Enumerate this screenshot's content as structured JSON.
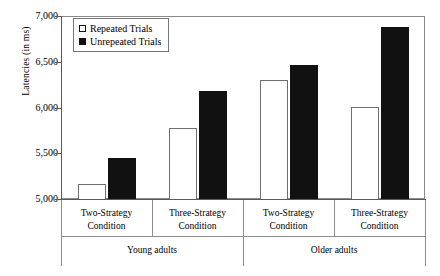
{
  "chart_data": {
    "type": "bar",
    "title": "",
    "xlabel": "",
    "ylabel": "Latencies (in ms)",
    "ylim": [
      5000,
      7000
    ],
    "ytick_labels": [
      "7,000",
      "6,500",
      "6,000",
      "5,500",
      "5,000"
    ],
    "ytick_values": [
      7000,
      6500,
      6000,
      5500,
      5000
    ],
    "grid": false,
    "legend_position": "top-left inside plot",
    "categories": [
      "Two-Strategy Condition",
      "Three-Strategy Condition",
      "Two-Strategy Condition",
      "Three-Strategy Condition"
    ],
    "category_lines": [
      [
        "Two-Strategy",
        "Condition"
      ],
      [
        "Three-Strategy",
        "Condition"
      ],
      [
        "Two-Strategy",
        "Condition"
      ],
      [
        "Three-Strategy",
        "Condition"
      ]
    ],
    "groups": [
      {
        "label": "Young adults",
        "categories": [
          0,
          1
        ]
      },
      {
        "label": "Older adults",
        "categories": [
          2,
          3
        ]
      }
    ],
    "series": [
      {
        "name": "Repeated Trials",
        "style": "open",
        "color": "#ffffff",
        "edge_color": "#6f6f6f",
        "values": [
          5165,
          5780,
          6300,
          6010
        ]
      },
      {
        "name": "Unrepeated Trials",
        "style": "filled",
        "color": "#111111",
        "edge_color": "#111111",
        "values": [
          5450,
          6180,
          6470,
          6880
        ]
      }
    ]
  },
  "legend": {
    "items": [
      {
        "label": "Repeated Trials",
        "style": "open"
      },
      {
        "label": "Unrepeated Trials",
        "style": "filled"
      }
    ]
  },
  "axis": {
    "y_title": "Latencies (in ms)"
  }
}
